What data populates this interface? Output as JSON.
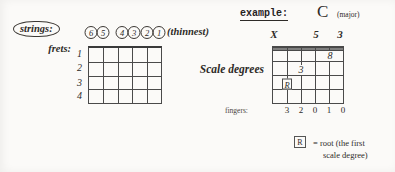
{
  "colors": {
    "background": "#fbfaf8",
    "ink": "#2e2b28",
    "grid_line": "#4a4a4a"
  },
  "header": {
    "example_label": "example:",
    "chord_name": "C",
    "chord_quality": "(major)"
  },
  "strings_legend": {
    "strings_label": "strings:",
    "string_numbers": [
      "6",
      "5",
      "4",
      "3",
      "2",
      "1"
    ],
    "thinnest_label": "(thinnest)"
  },
  "frets_legend": {
    "frets_label": "frets:",
    "fret_numbers": [
      "1",
      "2",
      "3",
      "4"
    ]
  },
  "scale_degrees": {
    "label": "Scale degrees",
    "above_grid": [
      {
        "string": "6",
        "mark": "X"
      },
      {
        "string": "3",
        "mark": "5"
      },
      {
        "string": "1",
        "mark": "3"
      }
    ],
    "on_grid": [
      {
        "string": "2",
        "fret": "1",
        "mark": "8"
      },
      {
        "string": "4",
        "fret": "2",
        "mark": "3"
      },
      {
        "string": "5",
        "fret": "3",
        "mark": "R",
        "boxed": true
      }
    ]
  },
  "fingers": {
    "label": "fingers:",
    "values": [
      "3",
      "2",
      "0",
      "1",
      "0"
    ]
  },
  "legend": {
    "symbol": "R",
    "definition_line1": "= root (the first",
    "definition_line2": "scale degree)"
  }
}
